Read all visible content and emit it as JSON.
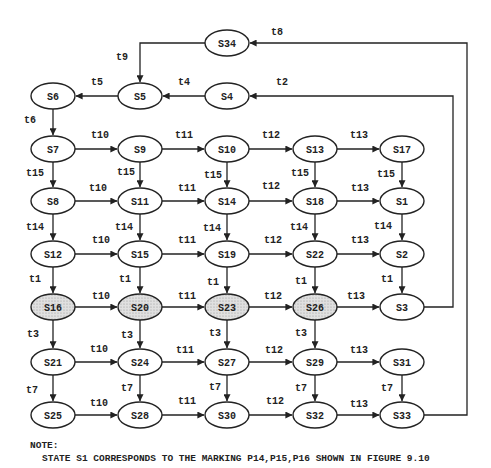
{
  "diagram": {
    "type": "state-reachability-graph",
    "colors": {
      "stroke": "#222222",
      "shaded_fill": "#d9d9d9",
      "node_fill": "#ffffff"
    },
    "nodes": [
      {
        "id": "S34",
        "x": 227,
        "y": 43,
        "shaded": false
      },
      {
        "id": "S6",
        "x": 53,
        "y": 96,
        "shaded": false
      },
      {
        "id": "S5",
        "x": 140,
        "y": 96,
        "shaded": false
      },
      {
        "id": "S4",
        "x": 227,
        "y": 96,
        "shaded": false
      },
      {
        "id": "S7",
        "x": 53,
        "y": 149,
        "shaded": false
      },
      {
        "id": "S9",
        "x": 140,
        "y": 149,
        "shaded": false
      },
      {
        "id": "S10",
        "x": 227,
        "y": 149,
        "shaded": false
      },
      {
        "id": "S13",
        "x": 315,
        "y": 149,
        "shaded": false
      },
      {
        "id": "S17",
        "x": 402,
        "y": 149,
        "shaded": false
      },
      {
        "id": "S8",
        "x": 53,
        "y": 201,
        "shaded": false
      },
      {
        "id": "S11",
        "x": 140,
        "y": 201,
        "shaded": false
      },
      {
        "id": "S14",
        "x": 227,
        "y": 201,
        "shaded": false
      },
      {
        "id": "S18",
        "x": 315,
        "y": 201,
        "shaded": false
      },
      {
        "id": "S1",
        "x": 402,
        "y": 201,
        "shaded": false
      },
      {
        "id": "S12",
        "x": 53,
        "y": 254,
        "shaded": false
      },
      {
        "id": "S15",
        "x": 140,
        "y": 254,
        "shaded": false
      },
      {
        "id": "S19",
        "x": 227,
        "y": 254,
        "shaded": false
      },
      {
        "id": "S22",
        "x": 315,
        "y": 254,
        "shaded": false
      },
      {
        "id": "S2",
        "x": 402,
        "y": 254,
        "shaded": false
      },
      {
        "id": "S16",
        "x": 53,
        "y": 307,
        "shaded": true
      },
      {
        "id": "S20",
        "x": 140,
        "y": 307,
        "shaded": true
      },
      {
        "id": "S23",
        "x": 227,
        "y": 307,
        "shaded": true
      },
      {
        "id": "S26",
        "x": 315,
        "y": 307,
        "shaded": true
      },
      {
        "id": "S3",
        "x": 402,
        "y": 307,
        "shaded": false
      },
      {
        "id": "S21",
        "x": 53,
        "y": 362,
        "shaded": false
      },
      {
        "id": "S24",
        "x": 140,
        "y": 362,
        "shaded": false
      },
      {
        "id": "S27",
        "x": 227,
        "y": 362,
        "shaded": false
      },
      {
        "id": "S29",
        "x": 315,
        "y": 362,
        "shaded": false
      },
      {
        "id": "S31",
        "x": 402,
        "y": 362,
        "shaded": false
      },
      {
        "id": "S25",
        "x": 53,
        "y": 415,
        "shaded": false
      },
      {
        "id": "S28",
        "x": 140,
        "y": 415,
        "shaded": false
      },
      {
        "id": "S30",
        "x": 227,
        "y": 415,
        "shaded": false
      },
      {
        "id": "S32",
        "x": 315,
        "y": 415,
        "shaded": false
      },
      {
        "id": "S33",
        "x": 402,
        "y": 415,
        "shaded": false
      }
    ],
    "edges": [
      {
        "from": "S34",
        "to": "S5",
        "label": "t9",
        "route": "elbow-left-down",
        "lx": 116,
        "ly": 60
      },
      {
        "from": "S5",
        "to": "S6",
        "label": "t5",
        "lx": 91,
        "ly": 85
      },
      {
        "from": "S4",
        "to": "S5",
        "label": "t4",
        "lx": 178,
        "ly": 85
      },
      {
        "from": "S6",
        "to": "S7",
        "label": "t6",
        "lx": 24,
        "ly": 123
      },
      {
        "from": "S7",
        "to": "S9",
        "label": "t10",
        "lx": 91,
        "ly": 138
      },
      {
        "from": "S9",
        "to": "S10",
        "label": "t11",
        "lx": 175,
        "ly": 138
      },
      {
        "from": "S10",
        "to": "S13",
        "label": "t12",
        "lx": 262,
        "ly": 138
      },
      {
        "from": "S13",
        "to": "S17",
        "label": "t13",
        "lx": 350,
        "ly": 138
      },
      {
        "from": "S7",
        "to": "S8",
        "label": "t15",
        "lx": 26,
        "ly": 176
      },
      {
        "from": "S9",
        "to": "S11",
        "label": "t15",
        "lx": 117,
        "ly": 175
      },
      {
        "from": "S10",
        "to": "S14",
        "label": "t15",
        "lx": 204,
        "ly": 178
      },
      {
        "from": "S13",
        "to": "S18",
        "label": "t15",
        "lx": 291,
        "ly": 176
      },
      {
        "from": "S17",
        "to": "S1",
        "label": "t15",
        "lx": 377,
        "ly": 177
      },
      {
        "from": "S8",
        "to": "S11",
        "label": "t10",
        "lx": 89,
        "ly": 191
      },
      {
        "from": "S11",
        "to": "S14",
        "label": "t11",
        "lx": 178,
        "ly": 191
      },
      {
        "from": "S14",
        "to": "S18",
        "label": "t12",
        "lx": 262,
        "ly": 189
      },
      {
        "from": "S18",
        "to": "S1",
        "label": "t13",
        "lx": 351,
        "ly": 191
      },
      {
        "from": "S8",
        "to": "S12",
        "label": "t14",
        "lx": 26,
        "ly": 230
      },
      {
        "from": "S11",
        "to": "S15",
        "label": "t14",
        "lx": 115,
        "ly": 230
      },
      {
        "from": "S14",
        "to": "S19",
        "label": "t14",
        "lx": 203,
        "ly": 231
      },
      {
        "from": "S18",
        "to": "S22",
        "label": "t14",
        "lx": 290,
        "ly": 230
      },
      {
        "from": "S1",
        "to": "S2",
        "label": "t14",
        "lx": 374,
        "ly": 229
      },
      {
        "from": "S12",
        "to": "S15",
        "label": "t10",
        "lx": 92,
        "ly": 243
      },
      {
        "from": "S15",
        "to": "S19",
        "label": "t11",
        "lx": 178,
        "ly": 243
      },
      {
        "from": "S19",
        "to": "S22",
        "label": "t12",
        "lx": 264,
        "ly": 243
      },
      {
        "from": "S22",
        "to": "S2",
        "label": "t13",
        "lx": 351,
        "ly": 243
      },
      {
        "from": "S12",
        "to": "S16",
        "label": "t1",
        "lx": 29,
        "ly": 282
      },
      {
        "from": "S15",
        "to": "S20",
        "label": "t1",
        "lx": 119,
        "ly": 282
      },
      {
        "from": "S19",
        "to": "S23",
        "label": "t1",
        "lx": 207,
        "ly": 285
      },
      {
        "from": "S22",
        "to": "S26",
        "label": "t1",
        "lx": 295,
        "ly": 284
      },
      {
        "from": "S2",
        "to": "S3",
        "label": "t1",
        "lx": 381,
        "ly": 282
      },
      {
        "from": "S16",
        "to": "S20",
        "label": "t10",
        "lx": 92,
        "ly": 299
      },
      {
        "from": "S20",
        "to": "S23",
        "label": "t11",
        "lx": 178,
        "ly": 299
      },
      {
        "from": "S23",
        "to": "S26",
        "label": "t12",
        "lx": 264,
        "ly": 299
      },
      {
        "from": "S26",
        "to": "S3",
        "label": "t13",
        "lx": 347,
        "ly": 299
      },
      {
        "from": "S3",
        "to": "S4",
        "label": "t2",
        "route": "return-right",
        "rx": 453,
        "lx": 276,
        "ly": 85
      },
      {
        "from": "S16",
        "to": "S21",
        "label": "t3",
        "lx": 27,
        "ly": 337
      },
      {
        "from": "S20",
        "to": "S24",
        "label": "t3",
        "lx": 121,
        "ly": 338
      },
      {
        "from": "S23",
        "to": "S27",
        "label": "t3",
        "lx": 209,
        "ly": 336
      },
      {
        "from": "S26",
        "to": "S29",
        "label": "t3",
        "lx": 295,
        "ly": 336
      },
      {
        "from": "S21",
        "to": "S24",
        "label": "t10",
        "lx": 90,
        "ly": 352
      },
      {
        "from": "S24",
        "to": "S27",
        "label": "t11",
        "lx": 176,
        "ly": 353
      },
      {
        "from": "S27",
        "to": "S29",
        "label": "t12",
        "lx": 265,
        "ly": 353
      },
      {
        "from": "S29",
        "to": "S31",
        "label": "t13",
        "lx": 350,
        "ly": 353
      },
      {
        "from": "S21",
        "to": "S25",
        "label": "t7",
        "lx": 26,
        "ly": 393
      },
      {
        "from": "S24",
        "to": "S28",
        "label": "t7",
        "lx": 121,
        "ly": 391
      },
      {
        "from": "S27",
        "to": "S30",
        "label": "t7",
        "lx": 209,
        "ly": 390
      },
      {
        "from": "S29",
        "to": "S32",
        "label": "t7",
        "lx": 295,
        "ly": 391
      },
      {
        "from": "S31",
        "to": "S33",
        "label": "t7",
        "lx": 381,
        "ly": 391
      },
      {
        "from": "S25",
        "to": "S28",
        "label": "t10",
        "lx": 90,
        "ly": 406
      },
      {
        "from": "S28",
        "to": "S30",
        "label": "t11",
        "lx": 178,
        "ly": 404
      },
      {
        "from": "S30",
        "to": "S32",
        "label": "t12",
        "lx": 266,
        "ly": 404
      },
      {
        "from": "S32",
        "to": "S33",
        "label": "t13",
        "lx": 350,
        "ly": 407
      },
      {
        "from": "S33",
        "to": "S34",
        "label": "t8",
        "route": "return-right",
        "rx": 467,
        "lx": 271,
        "ly": 35
      }
    ]
  },
  "note": {
    "heading": "NOTE:",
    "text": "STATE S1 CORRESPONDS TO THE MARKING P14,P15,P16 SHOWN IN FIGURE 9.10"
  }
}
